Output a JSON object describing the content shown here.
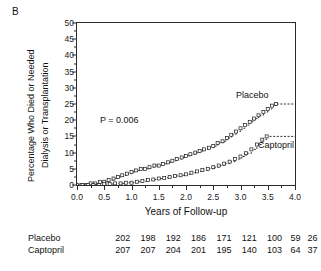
{
  "figure": {
    "panel_label": "B"
  },
  "chart_data": {
    "type": "line",
    "title": "",
    "subtitle": "",
    "xlabel": "Years of Follow-up",
    "ylabel": "Percentage Who Died or Needed Dialysis or Transplantation",
    "ylabel_line1": "Percentage Who Died or Needed",
    "ylabel_line2": "Dialysis or Transplantation",
    "xlim": [
      0.0,
      4.0
    ],
    "ylim": [
      0,
      50
    ],
    "xticks": [
      0.0,
      0.5,
      1.0,
      1.5,
      2.0,
      2.5,
      3.0,
      3.5,
      4.0
    ],
    "xtick_labels": [
      "0.0",
      "0.5",
      "1.0",
      "1.5",
      "2.0",
      "2.5",
      "3.0",
      "3.5",
      "4.0"
    ],
    "yticks": [
      0,
      5,
      10,
      15,
      20,
      25,
      30,
      35,
      40,
      45,
      50
    ],
    "ytick_labels": [
      "0",
      "5",
      "10",
      "15",
      "20",
      "25",
      "30",
      "35",
      "40",
      "45",
      "50"
    ],
    "grid": false,
    "legend_position": "inline-end-of-curve",
    "annotations": [
      {
        "text": "P = 0.006",
        "x": 0.55,
        "y": 20.5
      }
    ],
    "series": [
      {
        "name": "Placebo",
        "label": "Placebo",
        "marker": "open-square",
        "linestyle": "dashed-step",
        "color": "#1a1a1a",
        "label_x": 3.0,
        "label_y": 27.5,
        "points": [
          [
            0.0,
            0.0
          ],
          [
            0.08,
            0.0
          ],
          [
            0.17,
            0.0
          ],
          [
            0.25,
            0.5
          ],
          [
            0.33,
            0.5
          ],
          [
            0.42,
            1.0
          ],
          [
            0.5,
            1.0
          ],
          [
            0.58,
            1.5
          ],
          [
            0.67,
            2.0
          ],
          [
            0.75,
            2.5
          ],
          [
            0.83,
            3.0
          ],
          [
            0.92,
            3.5
          ],
          [
            1.0,
            4.0
          ],
          [
            1.08,
            4.5
          ],
          [
            1.17,
            5.0
          ],
          [
            1.25,
            5.0
          ],
          [
            1.33,
            5.5
          ],
          [
            1.42,
            6.0
          ],
          [
            1.5,
            6.0
          ],
          [
            1.58,
            6.5
          ],
          [
            1.67,
            7.0
          ],
          [
            1.75,
            7.5
          ],
          [
            1.83,
            8.0
          ],
          [
            1.92,
            8.5
          ],
          [
            2.0,
            9.0
          ],
          [
            2.08,
            9.5
          ],
          [
            2.17,
            10.0
          ],
          [
            2.25,
            10.5
          ],
          [
            2.33,
            11.0
          ],
          [
            2.42,
            11.5
          ],
          [
            2.5,
            12.0
          ],
          [
            2.58,
            13.0
          ],
          [
            2.67,
            13.5
          ],
          [
            2.75,
            14.5
          ],
          [
            2.83,
            15.5
          ],
          [
            2.92,
            16.5
          ],
          [
            3.0,
            17.5
          ],
          [
            3.08,
            18.5
          ],
          [
            3.17,
            19.5
          ],
          [
            3.25,
            20.5
          ],
          [
            3.33,
            21.5
          ],
          [
            3.42,
            22.5
          ],
          [
            3.5,
            23.5
          ],
          [
            3.58,
            24.5
          ],
          [
            3.65,
            25.0
          ],
          [
            4.0,
            25.0
          ]
        ]
      },
      {
        "name": "Captopril",
        "label": "Captopril",
        "marker": "open-square",
        "linestyle": "dashed-step",
        "color": "#1a1a1a",
        "label_x": 3.45,
        "label_y": 15.5,
        "points": [
          [
            0.0,
            0.0
          ],
          [
            0.1,
            0.0
          ],
          [
            0.2,
            0.0
          ],
          [
            0.3,
            0.0
          ],
          [
            0.4,
            0.0
          ],
          [
            0.5,
            0.3
          ],
          [
            0.6,
            0.3
          ],
          [
            0.7,
            0.5
          ],
          [
            0.8,
            0.5
          ],
          [
            0.9,
            0.7
          ],
          [
            1.0,
            0.7
          ],
          [
            1.1,
            1.0
          ],
          [
            1.2,
            1.2
          ],
          [
            1.3,
            1.5
          ],
          [
            1.4,
            1.7
          ],
          [
            1.5,
            2.0
          ],
          [
            1.6,
            2.2
          ],
          [
            1.7,
            2.5
          ],
          [
            1.8,
            2.8
          ],
          [
            1.9,
            3.0
          ],
          [
            2.0,
            3.3
          ],
          [
            2.1,
            3.8
          ],
          [
            2.2,
            4.2
          ],
          [
            2.3,
            4.6
          ],
          [
            2.4,
            5.0
          ],
          [
            2.5,
            5.5
          ],
          [
            2.6,
            6.0
          ],
          [
            2.7,
            6.6
          ],
          [
            2.8,
            7.2
          ],
          [
            2.9,
            8.0
          ],
          [
            3.0,
            8.8
          ],
          [
            3.1,
            9.8
          ],
          [
            3.2,
            11.0
          ],
          [
            3.3,
            12.5
          ],
          [
            3.4,
            14.0
          ],
          [
            3.48,
            15.0
          ],
          [
            4.0,
            15.0
          ]
        ]
      }
    ]
  },
  "risk_table": {
    "rows": [
      {
        "label": "Placebo",
        "values": [
          "202",
          "198",
          "192",
          "186",
          "171",
          "121",
          "100",
          "59",
          "26"
        ]
      },
      {
        "label": "Captopril",
        "values": [
          "207",
          "207",
          "204",
          "201",
          "195",
          "140",
          "103",
          "64",
          "37"
        ]
      }
    ]
  }
}
